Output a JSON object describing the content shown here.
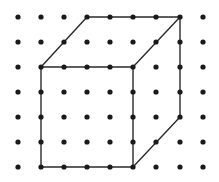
{
  "diagram": {
    "type": "dot-grid-cube",
    "grid": {
      "columns_x": [
        18,
        41,
        64,
        87,
        110,
        133,
        156,
        180,
        203
      ],
      "rows_y": [
        17,
        42,
        67,
        92,
        117,
        142,
        167
      ],
      "dot_radius": 2.6,
      "dot_color": "#1a1a1a"
    },
    "edges": [
      {
        "from": [
          41,
          67
        ],
        "to": [
          133,
          67
        ]
      },
      {
        "from": [
          133,
          67
        ],
        "to": [
          133,
          167
        ]
      },
      {
        "from": [
          133,
          167
        ],
        "to": [
          41,
          167
        ]
      },
      {
        "from": [
          41,
          167
        ],
        "to": [
          41,
          67
        ]
      },
      {
        "from": [
          87,
          17
        ],
        "to": [
          180,
          17
        ]
      },
      {
        "from": [
          41,
          67
        ],
        "to": [
          87,
          17
        ]
      },
      {
        "from": [
          133,
          67
        ],
        "to": [
          180,
          17
        ]
      },
      {
        "from": [
          180,
          17
        ],
        "to": [
          180,
          117
        ]
      },
      {
        "from": [
          133,
          167
        ],
        "to": [
          180,
          117
        ]
      }
    ],
    "line_color": "#2a2a2a",
    "line_width": 1.4
  }
}
